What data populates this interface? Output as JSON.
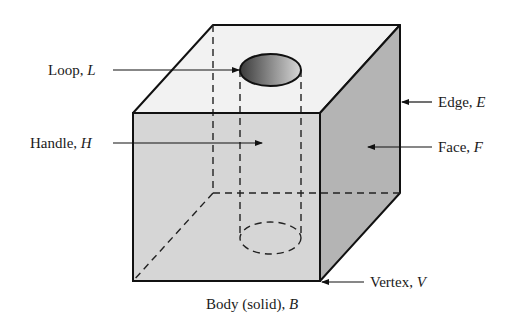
{
  "diagram": {
    "type": "b-rep solid topology illustration",
    "labels": {
      "loop": {
        "text": "Loop, ",
        "symbol": "L"
      },
      "handle": {
        "text": "Handle, ",
        "symbol": "H"
      },
      "edge": {
        "text": "Edge, ",
        "symbol": "E"
      },
      "face": {
        "text": "Face, ",
        "symbol": "F"
      },
      "vertex": {
        "text": "Vertex, ",
        "symbol": "V"
      },
      "body": {
        "text": "Body (solid), ",
        "symbol": "B"
      }
    },
    "colors": {
      "front_face": "#d6d6d6",
      "top_face": "#f2f2f2",
      "right_face": "#b4b4b4",
      "outline": "#111111",
      "hole_dark": "#4a4a4a",
      "hole_light": "#c8c8c8"
    }
  }
}
